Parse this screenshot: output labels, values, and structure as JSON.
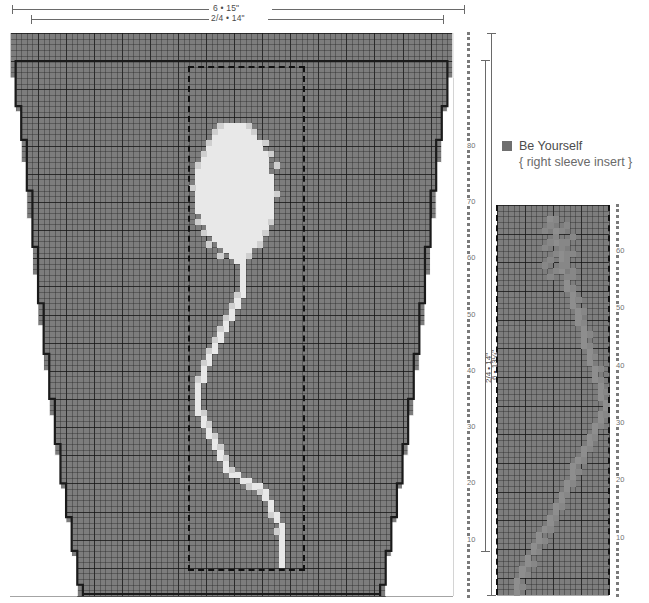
{
  "page": {
    "background": "#ffffff"
  },
  "colors": {
    "grid_fill": "#7d7d7d",
    "grid_line": "#2a2a2a",
    "motif_light": "#e8e8e8",
    "motif_mid": "#cfcfcf",
    "outline": "#1a1a1a",
    "legend_swatch": "#6f6f6f",
    "rule": "#6a6a6a",
    "tick_text": "#6f6f6f"
  },
  "top_dimensions": [
    {
      "id": "dim-row-1",
      "label": "6 • 15\""
    },
    {
      "id": "dim-row-2",
      "label": "2/4 • 14\""
    }
  ],
  "body_chart": {
    "name": "front body chart",
    "grid_cols": 79,
    "grid_rows": 100,
    "cell_px": 5.6,
    "major_every": 5,
    "insert_box": {
      "label": "insert placement box",
      "style": "dashed"
    },
    "motif": {
      "name": "balloon-motif",
      "description": "balloon with S-curved string"
    }
  },
  "body_axis": {
    "name": "row counter right of body chart",
    "tick_labels": [
      "80",
      "70",
      "60",
      "50",
      "40",
      "30",
      "20",
      "10"
    ],
    "tick_values": [
      80,
      70,
      60,
      50,
      40,
      30,
      20,
      10
    ],
    "tick_step": 10,
    "max": 100,
    "min": 0
  },
  "body_measurements": [
    {
      "id": "meas-inner",
      "label": "6 • 13¼\""
    },
    {
      "id": "meas-outer",
      "label": "2/4 • 14\""
    }
  ],
  "legend": {
    "swatch_color": "#6f6f6f",
    "title": "Be Yourself",
    "subtitle": "{ right sleeve insert }"
  },
  "sleeve_chart": {
    "name": "right sleeve insert chart",
    "grid_cols": 20,
    "grid_rows": 68,
    "cell_px": 5.6,
    "major_every": 5,
    "motif": {
      "name": "diagonal-string-motif",
      "description": "faint diagonal string running corner to corner"
    }
  },
  "sleeve_axis": {
    "name": "row counter right of sleeve chart",
    "tick_labels": [
      "60",
      "50",
      "40",
      "30",
      "20",
      "10"
    ],
    "tick_values": [
      60,
      50,
      40,
      30,
      20,
      10
    ],
    "tick_step": 10,
    "max": 68,
    "min": 0
  },
  "chart_data": {
    "type": "heatmap",
    "title": "Be Yourself",
    "subtitle": "{ right sleeve insert }",
    "xlabel": "",
    "ylabel": "",
    "grid": true,
    "legend_position": "right",
    "charts": [
      {
        "name": "front body chart",
        "cols": 79,
        "rows": 100,
        "row_axis_ticks": [
          10,
          20,
          30,
          40,
          50,
          60,
          70,
          80
        ],
        "width_labels": [
          "6 • 15\"",
          "2/4 • 14\""
        ],
        "height_labels": [
          "6 • 13¼\"",
          "2/4 • 14\""
        ],
        "shape": "tapered a-line body with stepped side edges",
        "motif_cells_light": "balloon head plus string",
        "insert_box_cols": [
          32,
          51
        ],
        "insert_box_rows": [
          6,
          94
        ]
      },
      {
        "name": "right sleeve insert chart",
        "cols": 20,
        "rows": 68,
        "row_axis_ticks": [
          10,
          20,
          30,
          40,
          50,
          60
        ],
        "shape": "rectangular panel bounded by dashed selvedges",
        "motif_cells_light": "diagonal string"
      }
    ]
  }
}
